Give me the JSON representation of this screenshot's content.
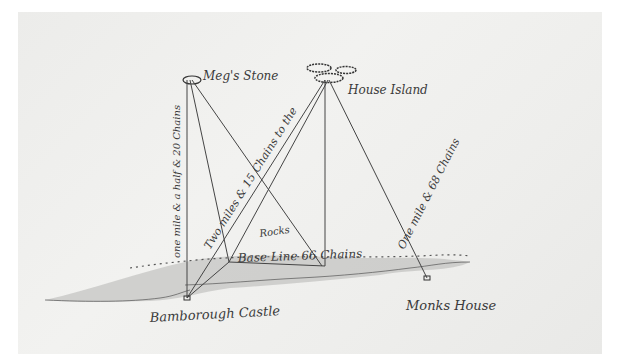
{
  "diagram": {
    "type": "survey triangulation sketch",
    "colors": {
      "ink": "#3a3a3a",
      "paper": "#efefed",
      "shore_shade": "#a9a9a9"
    },
    "places": {
      "megs_stone": "Meg's Stone",
      "house_island": "House Island",
      "bamborough_castle": "Bamborough Castle",
      "monks_house": "Monks House",
      "rocks": "Rocks"
    },
    "measurements": {
      "castle_to_megs_stone": "one mile & a half & 20 Chains",
      "base_to_house_island": "Two miles & 15 Chains to the",
      "base_line": "Base Line 66 Chains",
      "house_island_to_monks_house": "One mile & 68 Chains"
    }
  }
}
